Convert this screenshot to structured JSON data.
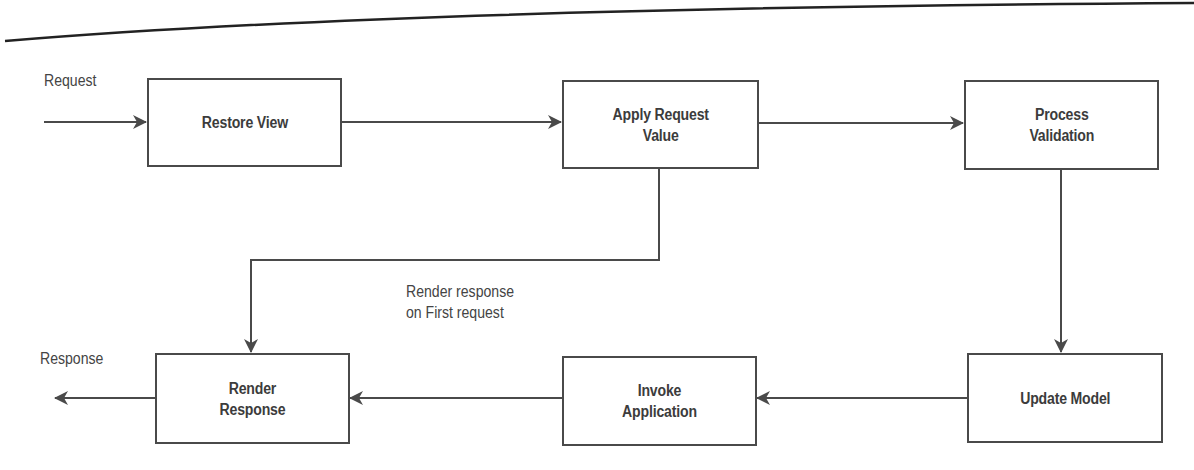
{
  "diagram": {
    "type": "flowchart",
    "colors": {
      "stroke": "#4a4a4a",
      "text": "#3c3c3c",
      "background": "#ffffff"
    },
    "nodes": [
      {
        "id": "restore_view",
        "label": "Restore View"
      },
      {
        "id": "apply_request_value",
        "label": "Apply Request\nValue"
      },
      {
        "id": "process_validation",
        "label": "Process\nValidation"
      },
      {
        "id": "update_model",
        "label": "Update Model"
      },
      {
        "id": "invoke_application",
        "label": "Invoke\nApplication"
      },
      {
        "id": "render_response",
        "label": "Render\nResponse"
      }
    ],
    "edges": [
      {
        "from": "external",
        "to": "restore_view",
        "label": "Request"
      },
      {
        "from": "restore_view",
        "to": "apply_request_value",
        "label": ""
      },
      {
        "from": "apply_request_value",
        "to": "process_validation",
        "label": ""
      },
      {
        "from": "apply_request_value",
        "to": "render_response",
        "label": "Render response\non First request"
      },
      {
        "from": "process_validation",
        "to": "update_model",
        "label": ""
      },
      {
        "from": "update_model",
        "to": "invoke_application",
        "label": ""
      },
      {
        "from": "invoke_application",
        "to": "render_response",
        "label": ""
      },
      {
        "from": "render_response",
        "to": "external",
        "label": "Response"
      }
    ],
    "labels": {
      "request": "Request",
      "response": "Response",
      "render_first": "Render response\non First request"
    }
  }
}
